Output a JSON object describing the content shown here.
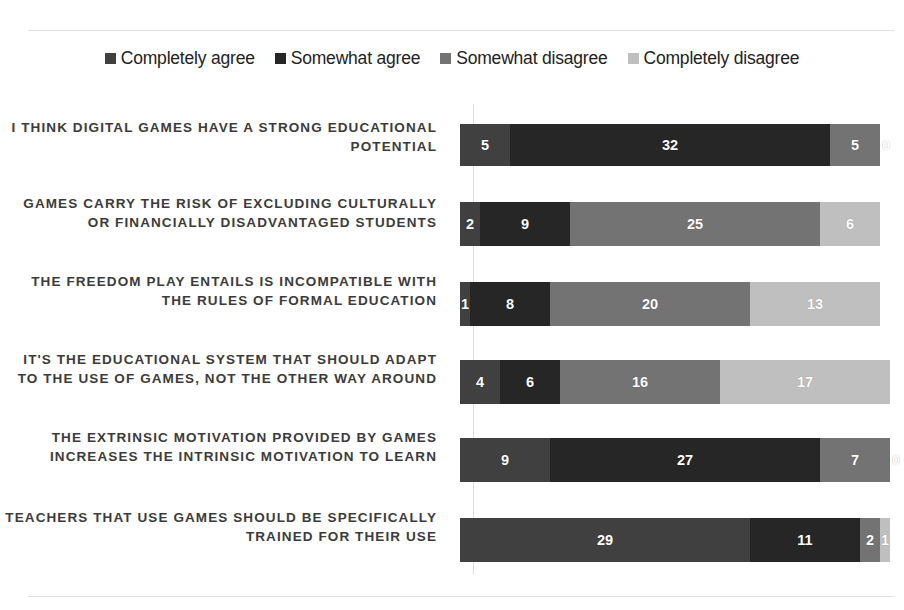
{
  "chart_data": {
    "type": "bar",
    "subtype": "stacked-horizontal-100",
    "title": "",
    "xlabel": "",
    "ylabel": "",
    "grid": false,
    "legend_position": "top-center",
    "axis_total": 42,
    "categories": [
      "I THINK DIGITAL GAMES HAVE A STRONG EDUCATIONAL POTENTIAL",
      "GAMES CARRY THE RISK OF EXCLUDING CULTURALLY OR FINANCIALLY DISADVANTAGED STUDENTS",
      "THE FREEDOM PLAY ENTAILS IS INCOMPATIBLE WITH THE RULES OF FORMAL EDUCATION",
      "IT'S THE EDUCATIONAL SYSTEM THAT SHOULD ADAPT TO THE USE OF GAMES, NOT THE OTHER WAY AROUND",
      "THE EXTRINSIC MOTIVATION PROVIDED BY GAMES INCREASES THE INTRINSIC MOTIVATION TO LEARN",
      "TEACHERS THAT USE GAMES SHOULD BE SPECIFICALLY TRAINED FOR THEIR USE"
    ],
    "series": [
      {
        "name": "Completely agree",
        "color": "#404040",
        "values": [
          5,
          2,
          1,
          4,
          9,
          29
        ]
      },
      {
        "name": "Somewhat agree",
        "color": "#262626",
        "values": [
          32,
          9,
          8,
          6,
          27,
          11
        ]
      },
      {
        "name": "Somewhat disagree",
        "color": "#737373",
        "values": [
          5,
          25,
          20,
          16,
          7,
          2
        ]
      },
      {
        "name": "Completely disagree",
        "color": "#bfbfbf",
        "values": [
          0,
          6,
          13,
          17,
          0,
          1
        ]
      }
    ],
    "rows": [
      {
        "label": "I THINK DIGITAL GAMES HAVE A STRONG EDUCATIONAL POTENTIAL",
        "segments": [
          {
            "series": "Completely agree",
            "value": 5,
            "color": "#404040"
          },
          {
            "series": "Somewhat agree",
            "value": 32,
            "color": "#262626"
          },
          {
            "series": "Somewhat disagree",
            "value": 5,
            "color": "#737373"
          },
          {
            "series": "Completely disagree",
            "value": 0,
            "color": "#bfbfbf"
          }
        ]
      },
      {
        "label": "GAMES CARRY THE RISK OF EXCLUDING CULTURALLY OR FINANCIALLY DISADVANTAGED STUDENTS",
        "segments": [
          {
            "series": "Completely agree",
            "value": 2,
            "color": "#404040"
          },
          {
            "series": "Somewhat agree",
            "value": 9,
            "color": "#262626"
          },
          {
            "series": "Somewhat disagree",
            "value": 25,
            "color": "#737373"
          },
          {
            "series": "Completely disagree",
            "value": 6,
            "color": "#bfbfbf"
          }
        ]
      },
      {
        "label": "THE FREEDOM PLAY ENTAILS IS INCOMPATIBLE WITH THE RULES OF FORMAL EDUCATION",
        "segments": [
          {
            "series": "Completely agree",
            "value": 1,
            "color": "#404040"
          },
          {
            "series": "Somewhat agree",
            "value": 8,
            "color": "#262626"
          },
          {
            "series": "Somewhat disagree",
            "value": 20,
            "color": "#737373"
          },
          {
            "series": "Completely disagree",
            "value": 13,
            "color": "#bfbfbf"
          }
        ]
      },
      {
        "label": "IT'S THE EDUCATIONAL SYSTEM THAT SHOULD ADAPT TO THE USE OF GAMES, NOT THE OTHER WAY AROUND",
        "segments": [
          {
            "series": "Completely agree",
            "value": 4,
            "color": "#404040"
          },
          {
            "series": "Somewhat agree",
            "value": 6,
            "color": "#262626"
          },
          {
            "series": "Somewhat disagree",
            "value": 16,
            "color": "#737373"
          },
          {
            "series": "Completely disagree",
            "value": 17,
            "color": "#bfbfbf"
          }
        ]
      },
      {
        "label": "THE EXTRINSIC MOTIVATION PROVIDED BY GAMES INCREASES THE INTRINSIC MOTIVATION TO LEARN",
        "segments": [
          {
            "series": "Completely agree",
            "value": 9,
            "color": "#404040"
          },
          {
            "series": "Somewhat agree",
            "value": 27,
            "color": "#262626"
          },
          {
            "series": "Somewhat disagree",
            "value": 7,
            "color": "#737373"
          },
          {
            "series": "Completely disagree",
            "value": 0,
            "color": "#bfbfbf"
          }
        ]
      },
      {
        "label": "TEACHERS THAT USE GAMES SHOULD BE SPECIFICALLY TRAINED FOR THEIR USE",
        "segments": [
          {
            "series": "Completely agree",
            "value": 29,
            "color": "#404040"
          },
          {
            "series": "Somewhat agree",
            "value": 11,
            "color": "#262626"
          },
          {
            "series": "Somewhat disagree",
            "value": 2,
            "color": "#737373"
          },
          {
            "series": "Completely disagree",
            "value": 1,
            "color": "#bfbfbf"
          }
        ]
      }
    ],
    "legend": [
      {
        "label": "Completely agree",
        "color": "#404040"
      },
      {
        "label": "Somewhat agree",
        "color": "#262626"
      },
      {
        "label": "Somewhat disagree",
        "color": "#737373"
      },
      {
        "label": "Completely disagree",
        "color": "#bfbfbf"
      }
    ]
  }
}
